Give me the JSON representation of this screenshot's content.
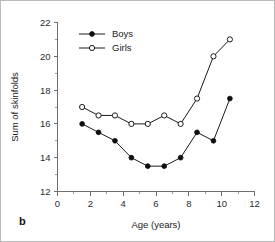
{
  "panel": {
    "label": "b"
  },
  "chart_data": {
    "type": "line",
    "title": "",
    "xlabel": "Age (years)",
    "ylabel": "Sum of skinfolds",
    "xlim": [
      0,
      12
    ],
    "ylim": [
      12,
      22
    ],
    "xticks": [
      0,
      2,
      4,
      6,
      8,
      10,
      12
    ],
    "xtick_labels": [
      "0",
      "2",
      "4",
      "6",
      "8",
      "10",
      "12"
    ],
    "xminor_ticks": [
      1,
      3,
      5,
      7,
      9,
      11
    ],
    "yticks": [
      12,
      14,
      16,
      18,
      20,
      22
    ],
    "ytick_labels": [
      "12",
      "14",
      "16",
      "18",
      "20",
      "22"
    ],
    "yminor_ticks": [
      13,
      15,
      17,
      19,
      21
    ],
    "grid": false,
    "legend_position": "top-left",
    "x": [
      1.5,
      2.5,
      3.5,
      4.5,
      5.5,
      6.5,
      7.5,
      8.5,
      9.5,
      10.5
    ],
    "series": [
      {
        "name": "Boys",
        "marker": "filled-circle",
        "color": "#0d0d0d",
        "values": [
          16.0,
          15.5,
          15.0,
          14.0,
          13.5,
          13.5,
          14.0,
          15.5,
          15.0,
          17.5
        ]
      },
      {
        "name": "Girls",
        "marker": "open-circle",
        "color": "#1a1a1a",
        "values": [
          17.0,
          16.5,
          16.5,
          16.0,
          16.0,
          16.5,
          16.0,
          17.5,
          20.0,
          21.0
        ]
      }
    ]
  }
}
